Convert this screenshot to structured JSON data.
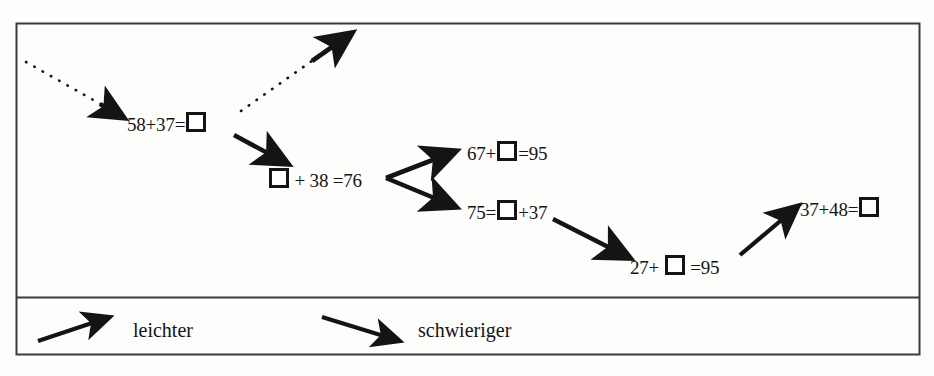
{
  "figure": {
    "title_present": false,
    "background_color": "#fdfdfc",
    "ink_color": "#141414",
    "frame": {
      "outer_border_color": "#3a3a3a",
      "divider_color": "#3a3a3a"
    }
  },
  "nodes": [
    {
      "id": "n1",
      "name": "node-58-plus-37",
      "parts": [
        "58+37=",
        "BOX"
      ],
      "text": "58+37=□",
      "left": 127,
      "top": 112
    },
    {
      "id": "n2",
      "name": "node-blank-plus-38",
      "parts": [
        "BOX",
        " + 38 =76"
      ],
      "text": "□ + 38 =76",
      "left": 268,
      "top": 168
    },
    {
      "id": "n3",
      "name": "node-67-plus-blank",
      "parts": [
        "67+",
        "BOX",
        "=95"
      ],
      "text": "67+□=95",
      "left": 467,
      "top": 141
    },
    {
      "id": "n4",
      "name": "node-75-equals-blank",
      "parts": [
        "75=",
        "BOX",
        "+37"
      ],
      "text": "75=□+37",
      "left": 467,
      "top": 200
    },
    {
      "id": "n5",
      "name": "node-27-plus-blank",
      "parts": [
        "27+ ",
        "BOX",
        " =95"
      ],
      "text": "27+ □ =95",
      "left": 630,
      "top": 255
    },
    {
      "id": "n6",
      "name": "node-37-plus-48",
      "parts": [
        "37+48=",
        "BOX"
      ],
      "text": "37+48=□",
      "left": 800,
      "top": 197
    }
  ],
  "arrows": [
    {
      "name": "arrow-incoming-dotted-to-n1",
      "style": "dotted",
      "from": [
        26,
        62
      ],
      "to": [
        124,
        118
      ],
      "meaning": "schwieriger"
    },
    {
      "name": "arrow-outgoing-dotted-from-n1",
      "style": "dotted",
      "from": [
        240,
        112
      ],
      "to": [
        356,
        30
      ],
      "meaning": "leichter"
    },
    {
      "name": "arrow-n1-to-n2",
      "style": "solid",
      "from": [
        232,
        134
      ],
      "to": [
        290,
        163
      ],
      "meaning": "schwieriger"
    },
    {
      "name": "arrow-n2-to-n3",
      "style": "solid",
      "from": [
        388,
        178
      ],
      "to": [
        460,
        150
      ],
      "meaning": "leichter"
    },
    {
      "name": "arrow-n2-to-n4",
      "style": "solid",
      "from": [
        388,
        178
      ],
      "to": [
        460,
        208
      ],
      "meaning": "schwieriger"
    },
    {
      "name": "arrow-n4-to-n5",
      "style": "solid",
      "from": [
        553,
        218
      ],
      "to": [
        632,
        257
      ],
      "meaning": "schwieriger"
    },
    {
      "name": "arrow-n5-to-n6",
      "style": "solid",
      "from": [
        742,
        255
      ],
      "to": [
        800,
        207
      ],
      "meaning": "leichter"
    }
  ],
  "legend": {
    "items": [
      {
        "name": "legend-leichter",
        "label": "leichter",
        "arrow_direction": "up-right",
        "arrow_from": [
          38,
          341
        ],
        "arrow_to": [
          112,
          317
        ],
        "label_left": 133,
        "label_top": 320
      },
      {
        "name": "legend-schwieriger",
        "label": "schwieriger",
        "arrow_direction": "down-right",
        "arrow_from": [
          322,
          317
        ],
        "arrow_to": [
          402,
          342
        ],
        "label_left": 418,
        "label_top": 320
      }
    ]
  }
}
